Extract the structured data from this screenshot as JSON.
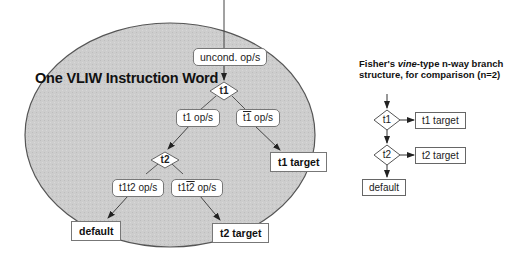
{
  "main_diagram": {
    "region_label": "One VLIW Instruction Word",
    "region_fill": "#cfcfcf",
    "nodes": {
      "uncond": "uncond. op/s",
      "test1": "t1",
      "t1_ops": "t1 op/s",
      "not_t1_ops_prefix": "",
      "not_t1_ops_overline": "t1",
      "not_t1_ops_suffix": " op/s",
      "test2": "t2",
      "t1t2_ops": "t1t2 op/s",
      "t1_not_t2_prefix": "t1",
      "t1_not_t2_overline": "t2",
      "t1_not_t2_suffix": " op/s",
      "t1_target": "t1 target",
      "default": "default",
      "t2_target": "t2 target"
    }
  },
  "comparison": {
    "title_line1_prefix": "Fisher's ",
    "title_line1_italic": "vine",
    "title_line1_suffix": "-type n-way branch",
    "title_line2": "structure, for comparison (n=2)",
    "nodes": {
      "test1": "t1",
      "t1_target": "t1 target",
      "test2": "t2",
      "t2_target": "t2 target",
      "default": "default"
    }
  }
}
